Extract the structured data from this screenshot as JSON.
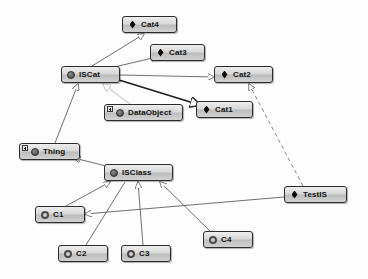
{
  "diagram": {
    "background_color": "#fdfdfd",
    "node_border_color": "#2b2b2b",
    "edge_color": "#6f6f6f",
    "edge_color_faint": "#cfcfcf",
    "edge_color_bold": "#1c1c1c",
    "icons": {
      "sphere": "filled-sphere-icon",
      "ring": "hollow-ring-icon",
      "diamond": "black-diamond-icon",
      "badge": "expand-plus-badge-icon"
    },
    "nodes": [
      {
        "id": "cat4",
        "label": "Cat4",
        "icon": "diamond",
        "badge": false,
        "x": 122,
        "y": 16,
        "w": 55
      },
      {
        "id": "cat3",
        "label": "Cat3",
        "icon": "diamond",
        "badge": false,
        "x": 150,
        "y": 44,
        "w": 55
      },
      {
        "id": "iscat",
        "label": "ISCat",
        "icon": "sphere",
        "badge": false,
        "x": 61,
        "y": 66,
        "w": 59
      },
      {
        "id": "cat2",
        "label": "Cat2",
        "icon": "diamond",
        "badge": false,
        "x": 214,
        "y": 66,
        "w": 59
      },
      {
        "id": "dataobject",
        "label": "DataObject",
        "icon": "sphere",
        "badge": true,
        "x": 104,
        "y": 104,
        "w": 79
      },
      {
        "id": "cat1",
        "label": "Cat1",
        "icon": "diamond",
        "badge": false,
        "x": 196,
        "y": 101,
        "w": 57
      },
      {
        "id": "thing",
        "label": "Thing",
        "icon": "sphere",
        "badge": true,
        "x": 19,
        "y": 143,
        "w": 61
      },
      {
        "id": "isclass",
        "label": "ISClass",
        "icon": "sphere",
        "badge": false,
        "x": 104,
        "y": 164,
        "w": 69
      },
      {
        "id": "testis",
        "label": "TestIS",
        "icon": "diamond",
        "badge": false,
        "x": 284,
        "y": 186,
        "w": 63
      },
      {
        "id": "c1",
        "label": "C1",
        "icon": "ring",
        "badge": false,
        "x": 35,
        "y": 206,
        "w": 50
      },
      {
        "id": "c4",
        "label": "C4",
        "icon": "ring",
        "badge": false,
        "x": 203,
        "y": 231,
        "w": 50
      },
      {
        "id": "c2",
        "label": "C2",
        "icon": "ring",
        "badge": false,
        "x": 58,
        "y": 245,
        "w": 50
      },
      {
        "id": "c3",
        "label": "C3",
        "icon": "ring",
        "badge": false,
        "x": 121,
        "y": 245,
        "w": 50
      }
    ],
    "edges": [
      {
        "from": "iscat",
        "to": "cat4",
        "style": "solid",
        "weight": "normal",
        "arrow": "hollow-triangle"
      },
      {
        "from": "iscat",
        "to": "cat3",
        "style": "solid",
        "weight": "normal",
        "arrow": "hollow-triangle"
      },
      {
        "from": "iscat",
        "to": "cat2",
        "style": "solid",
        "weight": "normal",
        "arrow": "hollow-triangle"
      },
      {
        "from": "iscat",
        "to": "cat1",
        "style": "solid",
        "weight": "bold",
        "arrow": "hollow-triangle"
      },
      {
        "from": "dataobject",
        "to": "iscat",
        "style": "solid",
        "weight": "faint",
        "arrow": "hollow-triangle"
      },
      {
        "from": "thing",
        "to": "iscat",
        "style": "solid",
        "weight": "normal",
        "arrow": "hollow-triangle"
      },
      {
        "from": "isclass",
        "to": "thing",
        "style": "solid",
        "weight": "normal",
        "arrow": "hollow-triangle"
      },
      {
        "from": "testis",
        "to": "cat2",
        "style": "dashed",
        "weight": "normal",
        "arrow": "hollow-triangle"
      },
      {
        "from": "c1",
        "to": "isclass",
        "style": "solid",
        "weight": "normal",
        "arrow": "hollow-triangle"
      },
      {
        "from": "c2",
        "to": "isclass",
        "style": "solid",
        "weight": "normal",
        "arrow": "none"
      },
      {
        "from": "c3",
        "to": "isclass",
        "style": "solid",
        "weight": "normal",
        "arrow": "hollow-triangle"
      },
      {
        "from": "c4",
        "to": "isclass",
        "style": "solid",
        "weight": "normal",
        "arrow": "hollow-triangle"
      },
      {
        "from": "testis",
        "to": "c1",
        "style": "solid",
        "weight": "normal",
        "arrow": "hollow-triangle"
      }
    ]
  }
}
